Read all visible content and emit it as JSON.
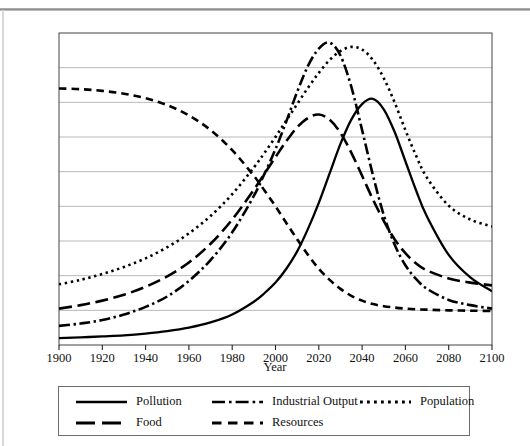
{
  "figure": {
    "axis_title": "Year",
    "plot": {
      "left": 59,
      "top": 33,
      "right": 492,
      "bottom": 345,
      "frame_color": "#555555",
      "grid_color": "#b0b0b0",
      "line_color": "#000000",
      "background": "#ffffff"
    }
  },
  "legend": {
    "items": [
      {
        "label": "Pollution",
        "style": "solid",
        "key": "pollution"
      },
      {
        "label": "Industrial Output",
        "style": "dash-dot",
        "key": "industrial_output"
      },
      {
        "label": "Population",
        "style": "dotted",
        "key": "population"
      },
      {
        "label": "Food",
        "style": "long-dash",
        "key": "food"
      },
      {
        "label": "Resources",
        "style": "dash",
        "key": "resources"
      }
    ]
  },
  "chart_data": {
    "type": "line",
    "title": "",
    "subtitle": "",
    "xlabel": "Year",
    "ylabel": "",
    "xlim": [
      1900,
      2100
    ],
    "ylim": [
      0,
      9
    ],
    "grid": true,
    "y_ticks_labeled": false,
    "y_gridline_count": 8,
    "legend_position": "below",
    "xticks": [
      1900,
      1920,
      1940,
      1960,
      1980,
      2000,
      2020,
      2040,
      2060,
      2080,
      2100
    ],
    "x": [
      1900,
      1910,
      1920,
      1930,
      1940,
      1950,
      1960,
      1970,
      1980,
      1990,
      1995,
      2000,
      2005,
      2010,
      2015,
      2020,
      2025,
      2030,
      2035,
      2040,
      2045,
      2050,
      2055,
      2060,
      2065,
      2070,
      2080,
      2090,
      2100
    ],
    "series": [
      {
        "name": "Pollution",
        "style": "solid",
        "color": "#000000",
        "values": [
          0.2,
          0.22,
          0.25,
          0.28,
          0.33,
          0.4,
          0.5,
          0.65,
          0.88,
          1.25,
          1.5,
          1.8,
          2.2,
          2.7,
          3.35,
          4.1,
          4.95,
          5.8,
          6.5,
          6.95,
          7.1,
          6.8,
          6.15,
          5.3,
          4.45,
          3.7,
          2.6,
          1.95,
          1.55
        ]
      },
      {
        "name": "Industrial Output",
        "style": "dash-dot",
        "color": "#000000",
        "values": [
          0.55,
          0.62,
          0.72,
          0.88,
          1.1,
          1.4,
          1.85,
          2.45,
          3.25,
          4.3,
          4.95,
          5.65,
          6.45,
          7.3,
          8.05,
          8.55,
          8.72,
          8.35,
          7.45,
          6.2,
          4.9,
          3.75,
          2.9,
          2.3,
          1.9,
          1.62,
          1.3,
          1.15,
          1.05
        ]
      },
      {
        "name": "Population",
        "style": "dotted",
        "color": "#000000",
        "values": [
          1.75,
          1.88,
          2.05,
          2.25,
          2.5,
          2.82,
          3.22,
          3.72,
          4.35,
          5.12,
          5.55,
          6.0,
          6.48,
          6.95,
          7.42,
          7.85,
          8.22,
          8.48,
          8.6,
          8.52,
          8.22,
          7.7,
          7.0,
          6.2,
          5.45,
          4.82,
          4.02,
          3.62,
          3.42
        ]
      },
      {
        "name": "Food",
        "style": "long-dash",
        "color": "#000000",
        "values": [
          1.05,
          1.15,
          1.28,
          1.45,
          1.68,
          1.98,
          2.38,
          2.92,
          3.62,
          4.48,
          4.95,
          5.42,
          5.88,
          6.28,
          6.55,
          6.65,
          6.5,
          6.12,
          5.55,
          4.88,
          4.2,
          3.58,
          3.05,
          2.65,
          2.35,
          2.15,
          1.92,
          1.8,
          1.72
        ]
      },
      {
        "name": "Resources",
        "style": "dash",
        "color": "#000000",
        "values": [
          7.4,
          7.38,
          7.33,
          7.25,
          7.12,
          6.92,
          6.62,
          6.2,
          5.62,
          4.88,
          4.45,
          4.0,
          3.52,
          3.05,
          2.6,
          2.2,
          1.88,
          1.62,
          1.42,
          1.28,
          1.18,
          1.12,
          1.08,
          1.05,
          1.03,
          1.02,
          1.0,
          0.99,
          0.98
        ]
      }
    ]
  }
}
